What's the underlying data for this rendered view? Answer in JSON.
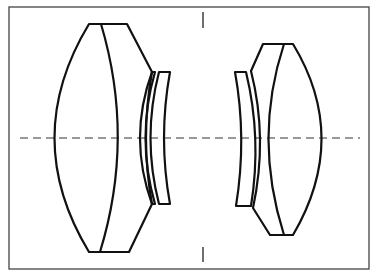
{
  "diagram": {
    "type": "optical-lens-layout",
    "colors": {
      "stroke": "#111111",
      "frame": "#444444",
      "background": "#ffffff"
    },
    "elements": [
      {
        "id": "front-cemented-doublet",
        "group": "front"
      },
      {
        "id": "front-meniscus-1",
        "group": "front"
      },
      {
        "id": "front-meniscus-2",
        "group": "front"
      },
      {
        "id": "rear-meniscus-1",
        "group": "rear"
      },
      {
        "id": "rear-cemented-doublet",
        "group": "rear"
      }
    ]
  }
}
